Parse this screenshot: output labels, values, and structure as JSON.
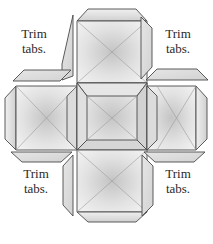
{
  "diagram": {
    "title": "",
    "colors": {
      "stroke": "#4a4a4a",
      "face_light": "#f2f2f2",
      "face_mid": "#d8d8d8",
      "face_dark": "#bdbdbd",
      "tab_fill": "#dcdcdc",
      "text": "#2a2a2a"
    },
    "labels": {
      "top_left": {
        "line1": "Trim",
        "line2": "tabs."
      },
      "top_right": {
        "line1": "Trim",
        "line2": "tabs."
      },
      "bottom_left": {
        "line1": "Trim",
        "line2": "tabs."
      },
      "bottom_right": {
        "line1": "Trim",
        "line2": "tabs."
      }
    },
    "pieces": [
      {
        "name": "top-square",
        "position": "top"
      },
      {
        "name": "left-square",
        "position": "left"
      },
      {
        "name": "center-square",
        "position": "center"
      },
      {
        "name": "right-square",
        "position": "right"
      },
      {
        "name": "bottom-square",
        "position": "bottom"
      }
    ],
    "trim_tabs": [
      {
        "corner": "top-left",
        "count": 2
      },
      {
        "corner": "top-right",
        "count": 2
      },
      {
        "corner": "bottom-left",
        "count": 2
      },
      {
        "corner": "bottom-right",
        "count": 2
      }
    ]
  }
}
